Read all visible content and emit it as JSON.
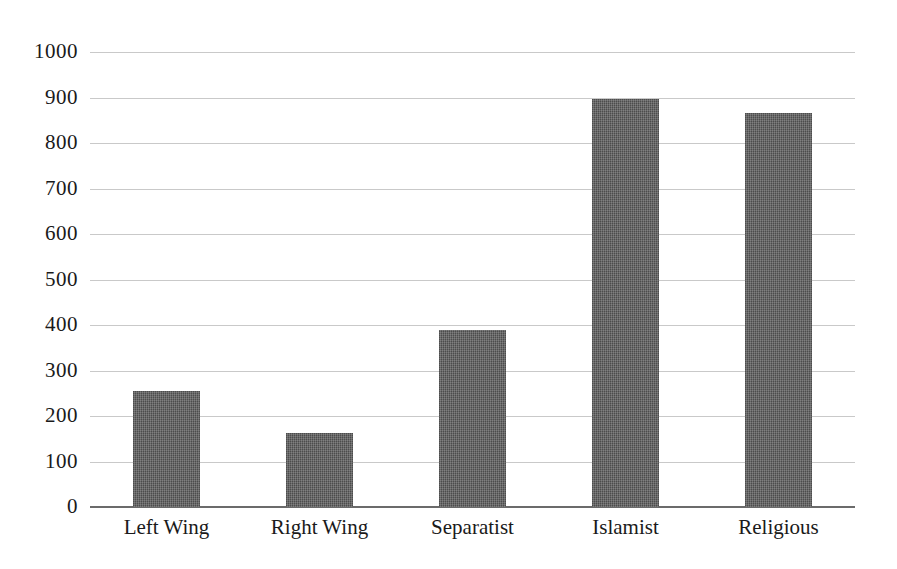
{
  "chart_data": {
    "type": "bar",
    "title": "",
    "subtitle": "",
    "xlabel": "",
    "ylabel": "",
    "categories": [
      "Left Wing",
      "Right Wing",
      "Separatist",
      "Islamist",
      "Religious"
    ],
    "values": [
      255,
      163,
      389,
      897,
      866
    ],
    "ylim": [
      0,
      1000
    ],
    "yticks": [
      0,
      100,
      200,
      300,
      400,
      500,
      600,
      700,
      800,
      900,
      1000
    ],
    "ytick_labels": [
      "0",
      "100",
      "200",
      "300",
      "400",
      "500",
      "600",
      "700",
      "800",
      "900",
      "1000"
    ],
    "grid": true,
    "legend": "none",
    "series": [
      {
        "name": "Attacks",
        "values": [
          255,
          163,
          389,
          897,
          866
        ],
        "color": "#5a5a5a"
      }
    ],
    "colors": {
      "bar_fill": "#5a5a5a",
      "gridline": "#c9c9c9",
      "axis_line": "#6b6b6b",
      "background": "#ffffff",
      "text": "#1a1a1a"
    }
  }
}
